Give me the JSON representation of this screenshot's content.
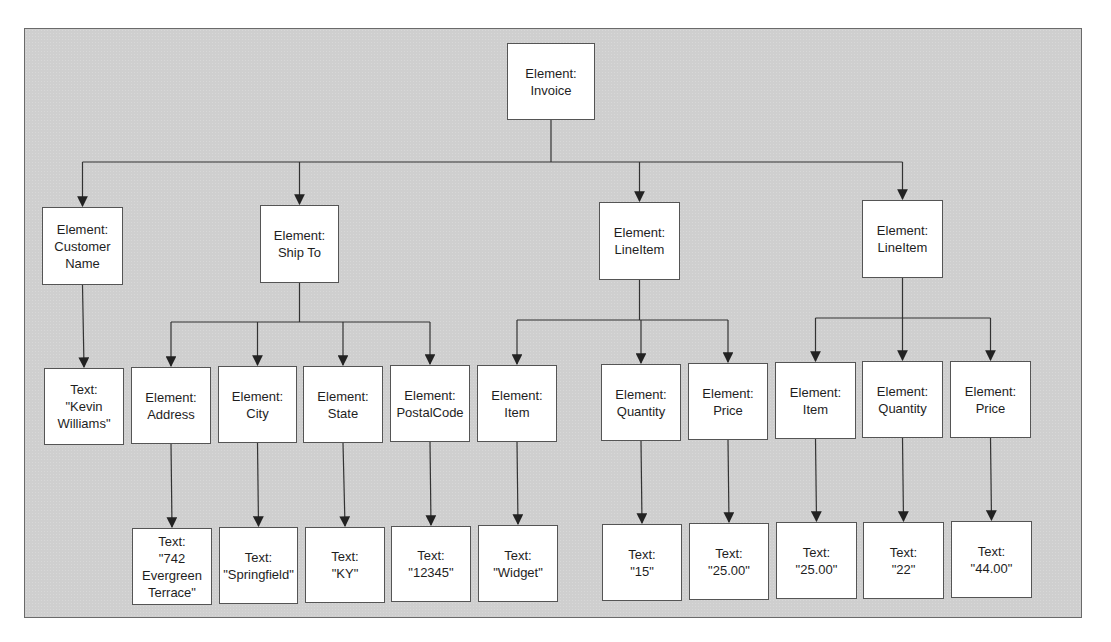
{
  "diagram": {
    "type": "tree",
    "root": {
      "id": "invoice",
      "label": "Element:\nInvoice",
      "children": [
        "customer_name",
        "ship_to",
        "line_item_1",
        "line_item_2"
      ]
    },
    "nodes": [
      {
        "id": "invoice",
        "label": "Element:\nInvoice",
        "x": 507,
        "y": 43,
        "w": 88,
        "h": 77
      },
      {
        "id": "customer_name",
        "label": "Element:\nCustomer\nName",
        "x": 42,
        "y": 207,
        "w": 81,
        "h": 78
      },
      {
        "id": "ship_to",
        "label": "Element:\nShip To",
        "x": 260,
        "y": 205,
        "w": 79,
        "h": 78
      },
      {
        "id": "line_item_1",
        "label": "Element:\nLineItem",
        "x": 599,
        "y": 202,
        "w": 81,
        "h": 78
      },
      {
        "id": "line_item_2",
        "label": "Element:\nLineItem",
        "x": 862,
        "y": 200,
        "w": 81,
        "h": 78
      },
      {
        "id": "text_kevin",
        "label": "Text:\n\"Kevin\nWilliams\"",
        "x": 44,
        "y": 368,
        "w": 80,
        "h": 77
      },
      {
        "id": "address",
        "label": "Element:\nAddress",
        "x": 131,
        "y": 367,
        "w": 80,
        "h": 77
      },
      {
        "id": "city",
        "label": "Element:\nCity",
        "x": 218,
        "y": 366,
        "w": 79,
        "h": 77
      },
      {
        "id": "state",
        "label": "Element:\nState",
        "x": 303,
        "y": 366,
        "w": 80,
        "h": 77
      },
      {
        "id": "postal_code",
        "label": "Element:\nPostalCode",
        "x": 390,
        "y": 365,
        "w": 80,
        "h": 77
      },
      {
        "id": "item_1",
        "label": "Element:\nItem",
        "x": 477,
        "y": 365,
        "w": 80,
        "h": 77
      },
      {
        "id": "quantity_1",
        "label": "Element:\nQuantity",
        "x": 601,
        "y": 364,
        "w": 80,
        "h": 77
      },
      {
        "id": "price_1",
        "label": "Element:\nPrice",
        "x": 688,
        "y": 363,
        "w": 80,
        "h": 77
      },
      {
        "id": "item_2",
        "label": "Element:\nItem",
        "x": 775,
        "y": 362,
        "w": 81,
        "h": 77
      },
      {
        "id": "quantity_2",
        "label": "Element:\nQuantity",
        "x": 862,
        "y": 361,
        "w": 81,
        "h": 77
      },
      {
        "id": "price_2",
        "label": "Element:\nPrice",
        "x": 950,
        "y": 361,
        "w": 81,
        "h": 77
      },
      {
        "id": "text_address",
        "label": "Text:\n\"742\nEvergreen\nTerrace\"",
        "x": 132,
        "y": 528,
        "w": 80,
        "h": 77
      },
      {
        "id": "text_city",
        "label": "Text:\n\"Springfield\"",
        "x": 219,
        "y": 527,
        "w": 79,
        "h": 77
      },
      {
        "id": "text_state",
        "label": "Text:\n\"KY\"",
        "x": 305,
        "y": 527,
        "w": 80,
        "h": 76
      },
      {
        "id": "text_postal",
        "label": "Text:\n\"12345\"",
        "x": 391,
        "y": 526,
        "w": 80,
        "h": 76
      },
      {
        "id": "text_item_1",
        "label": "Text:\n\"Widget\"",
        "x": 478,
        "y": 525,
        "w": 80,
        "h": 77
      },
      {
        "id": "text_quantity_1",
        "label": "Text:\n\"15\"",
        "x": 602,
        "y": 524,
        "w": 80,
        "h": 77
      },
      {
        "id": "text_price_1",
        "label": "Text:\n\"25.00\"",
        "x": 689,
        "y": 523,
        "w": 80,
        "h": 77
      },
      {
        "id": "text_item_2",
        "label": "Text:\n\"25.00\"",
        "x": 776,
        "y": 522,
        "w": 81,
        "h": 77
      },
      {
        "id": "text_quantity_2",
        "label": "Text:\n\"22\"",
        "x": 863,
        "y": 522,
        "w": 81,
        "h": 77
      },
      {
        "id": "text_price_2",
        "label": "Text:\n\"44.00\"",
        "x": 951,
        "y": 521,
        "w": 81,
        "h": 77
      }
    ],
    "edges": [
      [
        "invoice",
        "customer_name"
      ],
      [
        "invoice",
        "ship_to"
      ],
      [
        "invoice",
        "line_item_1"
      ],
      [
        "invoice",
        "line_item_2"
      ],
      [
        "customer_name",
        "text_kevin"
      ],
      [
        "ship_to",
        "address"
      ],
      [
        "ship_to",
        "city"
      ],
      [
        "ship_to",
        "state"
      ],
      [
        "ship_to",
        "postal_code"
      ],
      [
        "line_item_1",
        "item_1"
      ],
      [
        "line_item_1",
        "quantity_1"
      ],
      [
        "line_item_1",
        "price_1"
      ],
      [
        "line_item_2",
        "item_2"
      ],
      [
        "line_item_2",
        "quantity_2"
      ],
      [
        "line_item_2",
        "price_2"
      ],
      [
        "address",
        "text_address"
      ],
      [
        "city",
        "text_city"
      ],
      [
        "state",
        "text_state"
      ],
      [
        "postal_code",
        "text_postal"
      ],
      [
        "item_1",
        "text_item_1"
      ],
      [
        "quantity_1",
        "text_quantity_1"
      ],
      [
        "price_1",
        "text_price_1"
      ],
      [
        "item_2",
        "text_item_2"
      ],
      [
        "quantity_2",
        "text_quantity_2"
      ],
      [
        "price_2",
        "text_price_2"
      ]
    ],
    "connector_bus_y": {
      "invoice": 162,
      "ship_to": 322,
      "line_item_1": 320,
      "line_item_2": 318
    },
    "colors": {
      "canvas": "#cfcfcf",
      "node_fill": "#ffffff",
      "node_border": "#555555",
      "line": "#333333",
      "text": "#1e1e1e"
    }
  }
}
